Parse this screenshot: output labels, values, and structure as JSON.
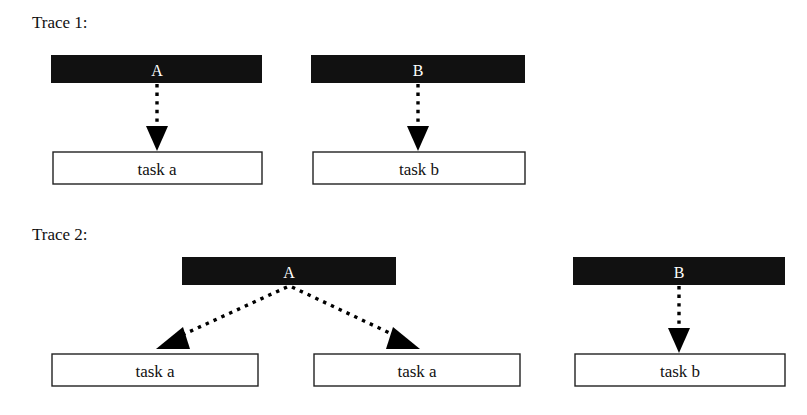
{
  "figure": {
    "type": "diagram",
    "kind": "event-to-task trace diagram",
    "background_color": "#ffffff",
    "bar_color": "#111111",
    "box_stroke_color": "#222222",
    "box_fill_color": "#ffffff",
    "connector_color": "#000000",
    "connector_style": "dotted-arrow"
  },
  "traces": [
    {
      "id": "trace-1",
      "label": "Trace 1:",
      "label_pos": {
        "x": 32,
        "y": 28
      },
      "events": [
        {
          "id": "trace1-event-a",
          "label": "A",
          "bar": {
            "x": 51,
            "y": 55,
            "width": 211,
            "height": 28
          },
          "label_pos": {
            "x": 157,
            "y": 76
          },
          "links": [
            {
              "id": "trace1-link-a-taska",
              "from": {
                "x": 157,
                "y": 83
              },
              "to": {
                "x": 157,
                "y": 127
              },
              "head": {
                "x": 157,
                "y": 150,
                "dir": "down"
              }
            }
          ]
        },
        {
          "id": "trace1-event-b",
          "label": "B",
          "bar": {
            "x": 311,
            "y": 55,
            "width": 214,
            "height": 28
          },
          "label_pos": {
            "x": 418,
            "y": 76
          },
          "links": [
            {
              "id": "trace1-link-b-taskb",
              "from": {
                "x": 418,
                "y": 83
              },
              "to": {
                "x": 418,
                "y": 127
              },
              "head": {
                "x": 418,
                "y": 150,
                "dir": "down"
              }
            }
          ]
        }
      ],
      "tasks": [
        {
          "id": "trace1-task-a",
          "label": "task a",
          "box": {
            "x": 53,
            "y": 152,
            "width": 209,
            "height": 32
          },
          "label_pos": {
            "x": 157,
            "y": 174
          }
        },
        {
          "id": "trace1-task-b",
          "label": "task b",
          "box": {
            "x": 313,
            "y": 152,
            "width": 212,
            "height": 32
          },
          "label_pos": {
            "x": 419,
            "y": 174
          }
        }
      ]
    },
    {
      "id": "trace-2",
      "label": "Trace 2:",
      "label_pos": {
        "x": 32,
        "y": 240
      },
      "events": [
        {
          "id": "trace2-event-a",
          "label": "A",
          "bar": {
            "x": 182,
            "y": 257,
            "width": 214,
            "height": 28
          },
          "label_pos": {
            "x": 289,
            "y": 278
          },
          "links": [
            {
              "id": "trace2-link-a-taska-left",
              "from": {
                "x": 289,
                "y": 286
              },
              "to": {
                "x": 179,
                "y": 334
              },
              "head": {
                "x": 160,
                "y": 345,
                "dir": "down-left"
              }
            },
            {
              "id": "trace2-link-a-taska-right",
              "from": {
                "x": 290,
                "y": 286
              },
              "to": {
                "x": 398,
                "y": 334
              },
              "head": {
                "x": 417,
                "y": 345,
                "dir": "down-right"
              }
            }
          ]
        },
        {
          "id": "trace2-event-b",
          "label": "B",
          "bar": {
            "x": 573,
            "y": 257,
            "width": 212,
            "height": 28
          },
          "label_pos": {
            "x": 679,
            "y": 278
          },
          "links": [
            {
              "id": "trace2-link-b-taskb",
              "from": {
                "x": 679,
                "y": 285
              },
              "to": {
                "x": 679,
                "y": 330
              },
              "head": {
                "x": 679,
                "y": 352,
                "dir": "down"
              }
            }
          ]
        }
      ],
      "tasks": [
        {
          "id": "trace2-task-a-left",
          "label": "task a",
          "box": {
            "x": 52,
            "y": 354,
            "width": 206,
            "height": 32
          },
          "label_pos": {
            "x": 155,
            "y": 376
          }
        },
        {
          "id": "trace2-task-a-right",
          "label": "task a",
          "box": {
            "x": 314,
            "y": 354,
            "width": 206,
            "height": 32
          },
          "label_pos": {
            "x": 417,
            "y": 376
          }
        },
        {
          "id": "trace2-task-b",
          "label": "task b",
          "box": {
            "x": 575,
            "y": 354,
            "width": 210,
            "height": 32
          },
          "label_pos": {
            "x": 680,
            "y": 376
          }
        }
      ]
    }
  ]
}
